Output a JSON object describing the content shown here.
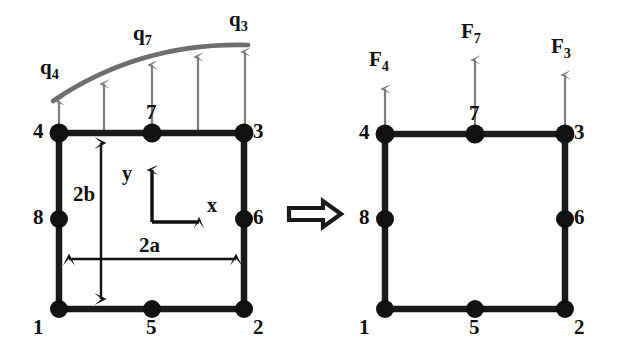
{
  "figure": {
    "type": "finite-element-load-equivalence-diagram",
    "colors": {
      "element_line": "#1a1a1a",
      "node_fill": "#111111",
      "load_arrow": "#7d7d7d",
      "load_curve": "#6e6e6e",
      "implication_arrow": "#1a1a1a",
      "dimension_line": "#111111",
      "background": "#ffffff"
    },
    "operator": {
      "name": "implies-arrow",
      "symbol": "=>"
    }
  },
  "left_element": {
    "name": "element-with-distributed-load",
    "nodes": [
      {
        "id": "1",
        "label": "1",
        "x": 59,
        "y": 309
      },
      {
        "id": "2",
        "label": "2",
        "x": 244,
        "y": 309
      },
      {
        "id": "3",
        "label": "3",
        "x": 244,
        "y": 133
      },
      {
        "id": "4",
        "label": "4",
        "x": 59,
        "y": 133
      },
      {
        "id": "5",
        "label": "5",
        "x": 152,
        "y": 309
      },
      {
        "id": "6",
        "label": "6",
        "x": 244,
        "y": 219
      },
      {
        "id": "7",
        "label": "7",
        "x": 152,
        "y": 133
      },
      {
        "id": "8",
        "label": "8",
        "x": 59,
        "y": 219
      }
    ],
    "load_labels": [
      {
        "name": "load-label-q4",
        "base": "q",
        "sub": "4"
      },
      {
        "name": "load-label-q7",
        "base": "q",
        "sub": "7"
      },
      {
        "name": "load-label-q3",
        "base": "q",
        "sub": "3"
      }
    ],
    "load_arrows": [
      {
        "x": 59,
        "tip_y": 97
      },
      {
        "x": 104,
        "tip_y": 80
      },
      {
        "x": 152,
        "tip_y": 61
      },
      {
        "x": 198,
        "tip_y": 53
      },
      {
        "x": 245,
        "tip_y": 48
      }
    ],
    "dimensions": [
      {
        "name": "height-dimension",
        "label": "2b",
        "orientation": "vertical"
      },
      {
        "name": "width-dimension",
        "label": "2a",
        "orientation": "horizontal"
      }
    ],
    "axes": [
      {
        "name": "y-axis",
        "label": "y",
        "direction": "up"
      },
      {
        "name": "x-axis",
        "label": "x",
        "direction": "right"
      }
    ]
  },
  "right_element": {
    "name": "element-with-nodal-forces",
    "nodes": [
      {
        "id": "1",
        "label": "1",
        "x": 385,
        "y": 309
      },
      {
        "id": "2",
        "label": "2",
        "x": 565,
        "y": 309
      },
      {
        "id": "3",
        "label": "3",
        "x": 565,
        "y": 134
      },
      {
        "id": "4",
        "label": "4",
        "x": 385,
        "y": 134
      },
      {
        "id": "5",
        "label": "5",
        "x": 475,
        "y": 309
      },
      {
        "id": "6",
        "label": "6",
        "x": 565,
        "y": 219
      },
      {
        "id": "7",
        "label": "7",
        "x": 475,
        "y": 134
      },
      {
        "id": "8",
        "label": "8",
        "x": 385,
        "y": 219
      }
    ],
    "forces": [
      {
        "name": "force-F4",
        "base": "F",
        "sub": "4",
        "x": 385,
        "tip_y": 85
      },
      {
        "name": "force-F7",
        "base": "F",
        "sub": "7",
        "x": 475,
        "tip_y": 56
      },
      {
        "name": "force-F3",
        "base": "F",
        "sub": "3",
        "x": 565,
        "tip_y": 71
      }
    ]
  }
}
